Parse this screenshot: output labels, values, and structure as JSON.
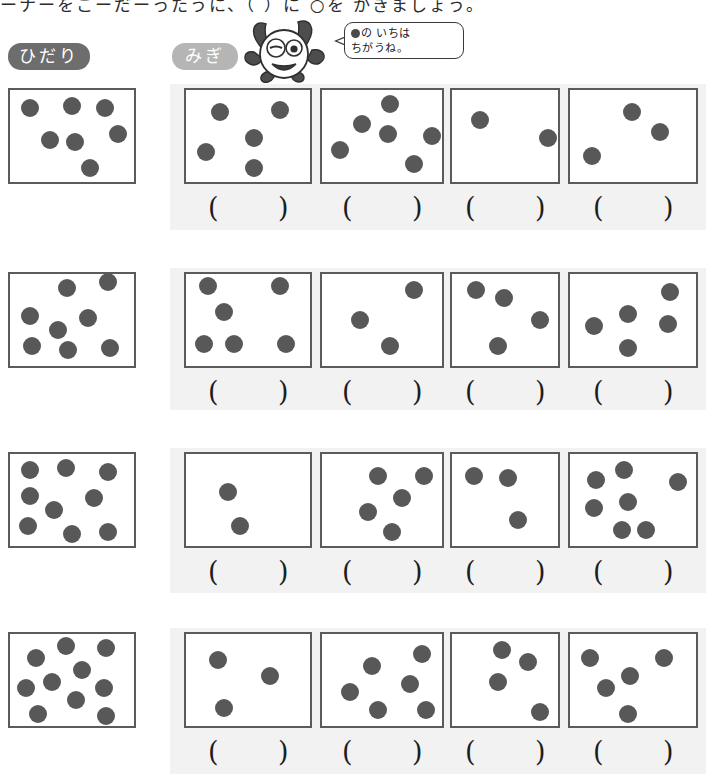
{
  "worksheet": {
    "top_instruction": "ーナーをこーだーったうに、（ ）に ○を かきましょう。",
    "label_left": "ひだり",
    "label_right": "みぎ",
    "mascot_bubble_line1": "の いちは",
    "mascot_bubble_line2": "ちがうね。",
    "paren_open": "(",
    "paren_close": ")",
    "colors": {
      "pill_left_bg": "#6d6d6d",
      "pill_right_bg": "#b5b5b5",
      "panel_bg": "#f2f2f2",
      "box_border": "#5b5b5b",
      "dot_fill": "#585858"
    }
  },
  "rows": [
    {
      "row_index": 1,
      "left": {
        "count": 7,
        "dots": [
          [
            20,
            18
          ],
          [
            62,
            16
          ],
          [
            95,
            18
          ],
          [
            40,
            50
          ],
          [
            65,
            52
          ],
          [
            108,
            44
          ],
          [
            80,
            78
          ]
        ]
      },
      "answers": [
        "",
        "",
        "",
        ""
      ],
      "right": [
        {
          "count": 5,
          "dots": [
            [
              34,
              22
            ],
            [
              94,
              20
            ],
            [
              68,
              48
            ],
            [
              20,
              62
            ],
            [
              68,
              78
            ]
          ]
        },
        {
          "count": 6,
          "dots": [
            [
              68,
              14
            ],
            [
              40,
              34
            ],
            [
              18,
              60
            ],
            [
              66,
              44
            ],
            [
              110,
              46
            ],
            [
              92,
              74
            ]
          ]
        },
        {
          "count": 2,
          "dots": [
            [
              28,
              30
            ],
            [
              96,
              48
            ]
          ]
        },
        {
          "count": 3,
          "dots": [
            [
              62,
              22
            ],
            [
              90,
              42
            ],
            [
              22,
              66
            ]
          ]
        }
      ]
    },
    {
      "row_index": 2,
      "left": {
        "count": 8,
        "dots": [
          [
            57,
            14
          ],
          [
            98,
            8
          ],
          [
            20,
            42
          ],
          [
            48,
            56
          ],
          [
            78,
            44
          ],
          [
            22,
            72
          ],
          [
            58,
            76
          ],
          [
            100,
            74
          ]
        ]
      },
      "answers": [
        "",
        "",
        "",
        ""
      ],
      "right": [
        {
          "count": 6,
          "dots": [
            [
              22,
              12
            ],
            [
              94,
              12
            ],
            [
              38,
              38
            ],
            [
              18,
              70
            ],
            [
              48,
              70
            ],
            [
              100,
              70
            ]
          ]
        },
        {
          "count": 3,
          "dots": [
            [
              92,
              16
            ],
            [
              38,
              46
            ],
            [
              68,
              72
            ]
          ]
        },
        {
          "count": 4,
          "dots": [
            [
              24,
              16
            ],
            [
              52,
              24
            ],
            [
              88,
              46
            ],
            [
              46,
              72
            ]
          ]
        },
        {
          "count": 5,
          "dots": [
            [
              100,
              18
            ],
            [
              58,
              40
            ],
            [
              24,
              52
            ],
            [
              98,
              50
            ],
            [
              58,
              74
            ]
          ]
        }
      ]
    },
    {
      "row_index": 3,
      "left": {
        "count": 9,
        "dots": [
          [
            20,
            16
          ],
          [
            56,
            14
          ],
          [
            98,
            18
          ],
          [
            20,
            42
          ],
          [
            84,
            44
          ],
          [
            44,
            56
          ],
          [
            18,
            72
          ],
          [
            62,
            80
          ],
          [
            98,
            78
          ]
        ]
      },
      "answers": [
        "",
        "",
        "",
        ""
      ],
      "right": [
        {
          "count": 2,
          "dots": [
            [
              42,
              38
            ],
            [
              54,
              72
            ]
          ]
        },
        {
          "count": 5,
          "dots": [
            [
              56,
              22
            ],
            [
              102,
              22
            ],
            [
              80,
              44
            ],
            [
              46,
              58
            ],
            [
              70,
              78
            ]
          ]
        },
        {
          "count": 3,
          "dots": [
            [
              22,
              22
            ],
            [
              56,
              24
            ],
            [
              66,
              66
            ]
          ]
        },
        {
          "count": 7,
          "dots": [
            [
              26,
              26
            ],
            [
              54,
              16
            ],
            [
              108,
              28
            ],
            [
              58,
              48
            ],
            [
              24,
              54
            ],
            [
              52,
              76
            ],
            [
              76,
              76
            ]
          ]
        }
      ]
    },
    {
      "row_index": 4,
      "left": {
        "count": 10,
        "dots": [
          [
            56,
            12
          ],
          [
            96,
            14
          ],
          [
            26,
            24
          ],
          [
            72,
            36
          ],
          [
            16,
            54
          ],
          [
            42,
            48
          ],
          [
            94,
            54
          ],
          [
            66,
            66
          ],
          [
            28,
            80
          ],
          [
            96,
            82
          ]
        ]
      },
      "answers": [
        "",
        "",
        "",
        ""
      ],
      "right": [
        {
          "count": 3,
          "dots": [
            [
              32,
              26
            ],
            [
              84,
              42
            ],
            [
              38,
              74
            ]
          ]
        },
        {
          "count": 6,
          "dots": [
            [
              100,
              20
            ],
            [
              50,
              32
            ],
            [
              88,
              50
            ],
            [
              28,
              58
            ],
            [
              56,
              76
            ],
            [
              104,
              76
            ]
          ]
        },
        {
          "count": 4,
          "dots": [
            [
              50,
              16
            ],
            [
              76,
              28
            ],
            [
              46,
              48
            ],
            [
              88,
              78
            ]
          ]
        },
        {
          "count": 5,
          "dots": [
            [
              20,
              24
            ],
            [
              94,
              24
            ],
            [
              60,
              42
            ],
            [
              36,
              54
            ],
            [
              58,
              80
            ]
          ]
        }
      ]
    }
  ]
}
